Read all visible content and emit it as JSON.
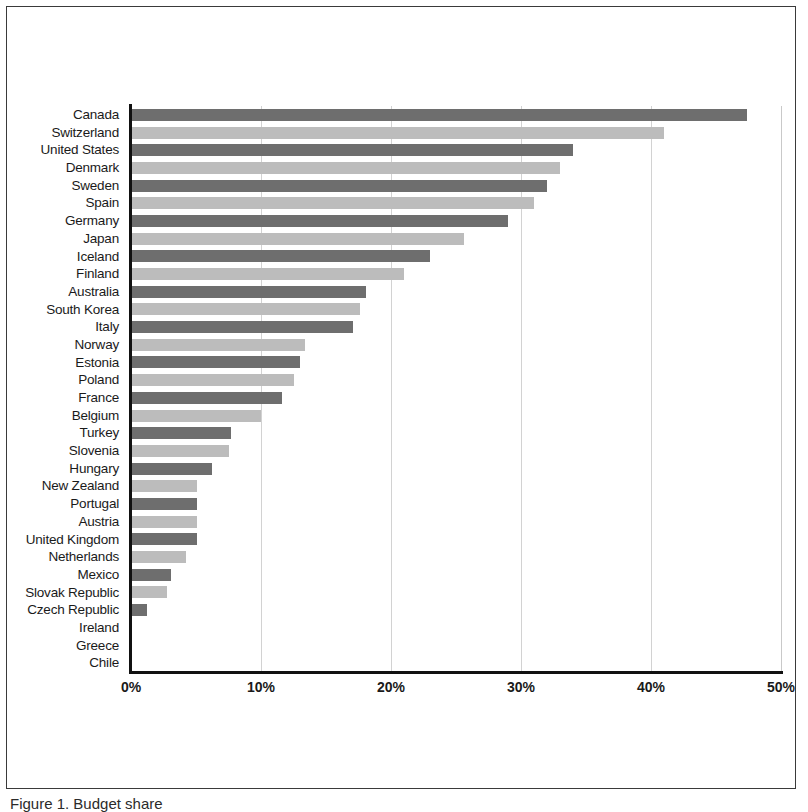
{
  "figure": {
    "caption": "Figure 1. Budget share",
    "background_color": "#ffffff",
    "border_color": "#3a3a3a"
  },
  "axis": {
    "x_tick_labels": [
      "0%",
      "10%",
      "20%",
      "30%",
      "40%",
      "50%"
    ],
    "x_tick_values": [
      0,
      10,
      20,
      30,
      40,
      50
    ],
    "axis_line_color": "#111111",
    "gridline_color": "#d2d2d2"
  },
  "series_colors": {
    "dark": "#6e6e6e",
    "light": "#bcbcbc"
  },
  "chart_data": {
    "type": "bar",
    "orientation": "horizontal",
    "title": "",
    "subtitle": "",
    "xlabel": "",
    "ylabel": "",
    "xlim": [
      0,
      50
    ],
    "x_unit": "percent",
    "grid": true,
    "legend": "none",
    "categories": [
      "Canada",
      "Switzerland",
      "United States",
      "Denmark",
      "Sweden",
      "Spain",
      "Germany",
      "Japan",
      "Iceland",
      "Finland",
      "Australia",
      "South Korea",
      "Italy",
      "Norway",
      "Estonia",
      "Poland",
      "France",
      "Belgium",
      "Turkey",
      "Slovenia",
      "Hungary",
      "New Zealand",
      "Portugal",
      "Austria",
      "United Kingdom",
      "Netherlands",
      "Mexico",
      "Slovak Republic",
      "Czech Republic",
      "Ireland",
      "Greece",
      "Chile"
    ],
    "values": [
      47.4,
      41.0,
      34.0,
      33.0,
      32.0,
      31.0,
      29.0,
      25.6,
      23.0,
      21.0,
      18.1,
      17.6,
      17.1,
      13.4,
      13.0,
      12.5,
      11.6,
      10.0,
      7.7,
      7.5,
      6.2,
      5.1,
      5.1,
      5.1,
      5.1,
      4.2,
      3.1,
      2.8,
      1.2,
      0.0,
      0.0,
      0.0
    ]
  }
}
